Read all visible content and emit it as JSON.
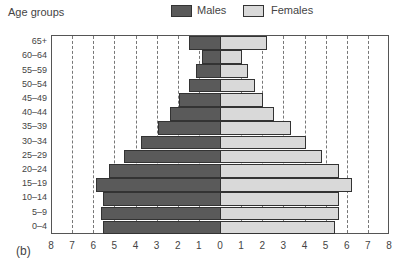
{
  "chart_data": {
    "type": "bar",
    "subtype": "population-pyramid",
    "title": "",
    "ylabel": "Age groups",
    "xlabel": "",
    "panel_label": "(b)",
    "categories": [
      "65+",
      "60–64",
      "55–59",
      "50–54",
      "45–49",
      "40–44",
      "35–39",
      "30–34",
      "25–29",
      "20–24",
      "15–19",
      "10–14",
      "5–9",
      "0–4"
    ],
    "series": [
      {
        "name": "Males",
        "color": "#5a5a5a",
        "values": [
          1.5,
          0.9,
          1.2,
          1.5,
          2.0,
          2.4,
          3.0,
          3.8,
          4.6,
          5.3,
          5.9,
          5.6,
          5.7,
          5.6
        ]
      },
      {
        "name": "Females",
        "color": "#d9d9d9",
        "values": [
          2.2,
          1.0,
          1.3,
          1.6,
          2.0,
          2.5,
          3.3,
          4.0,
          4.8,
          5.6,
          6.2,
          5.6,
          5.6,
          5.4
        ]
      }
    ],
    "xticks": [
      "8",
      "7",
      "6",
      "5",
      "4",
      "3",
      "2",
      "1",
      "0",
      "1",
      "2",
      "3",
      "4",
      "5",
      "6",
      "7",
      "8"
    ],
    "xlim": [
      -8,
      8
    ],
    "grid": "vertical dashed at each integer",
    "legend_position": "top-center",
    "legend": [
      "Males",
      "Females"
    ]
  },
  "labels": {
    "y_title": "Age groups",
    "legend_males": "Males",
    "legend_females": "Females",
    "panel": "(b)"
  }
}
